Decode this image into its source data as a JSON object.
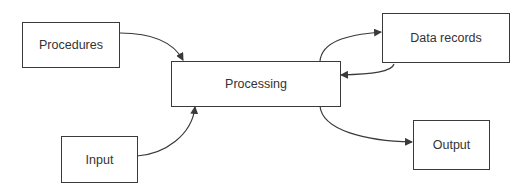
{
  "diagram": {
    "type": "flow",
    "nodes": [
      {
        "id": "procedures",
        "label": "Procedures"
      },
      {
        "id": "processing",
        "label": "Processing"
      },
      {
        "id": "data_records",
        "label": "Data records"
      },
      {
        "id": "input",
        "label": "Input"
      },
      {
        "id": "output",
        "label": "Output"
      }
    ],
    "edges": [
      {
        "from": "procedures",
        "to": "processing"
      },
      {
        "from": "input",
        "to": "processing"
      },
      {
        "from": "processing",
        "to": "data_records"
      },
      {
        "from": "data_records",
        "to": "processing"
      },
      {
        "from": "processing",
        "to": "output"
      }
    ],
    "colors": {
      "line": "#3a3a3a",
      "text": "#333333",
      "background": "#ffffff"
    }
  }
}
